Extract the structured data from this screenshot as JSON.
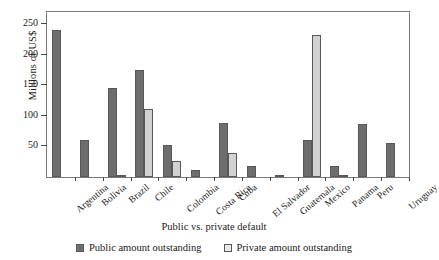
{
  "chart_data": {
    "type": "bar",
    "title": "",
    "xlabel": "Public vs. private default",
    "ylabel": "Millions of US$",
    "ylim": [
      0,
      270
    ],
    "yticks": [
      50,
      100,
      150,
      200,
      250
    ],
    "grid": false,
    "legend_position": "bottom",
    "categories": [
      "Argentina",
      "Bolivia",
      "Brazil",
      "Chile",
      "Colombia",
      "Costa Rica",
      "Cuba",
      "El Salvador",
      "Guatemala",
      "Mexico",
      "Panama",
      "Peru",
      "Uruguay"
    ],
    "series": [
      {
        "name": "Public amount outstanding",
        "color": "#6d6d6d",
        "values": [
          240,
          60,
          145,
          175,
          53,
          12,
          88,
          18,
          3,
          60,
          18,
          86,
          55
        ]
      },
      {
        "name": "Private amount outstanding",
        "color": "#d2d2d2",
        "values": [
          0,
          0,
          2,
          112,
          27,
          0,
          40,
          0,
          0,
          233,
          3,
          0,
          0
        ]
      }
    ]
  },
  "legend": {
    "entries": [
      {
        "label": "Public amount outstanding"
      },
      {
        "label": "Private amount outstanding"
      }
    ]
  }
}
